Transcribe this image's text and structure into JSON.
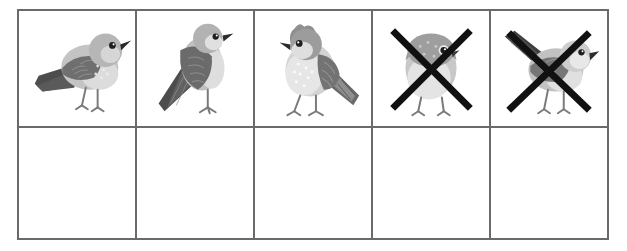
{
  "worksheet": {
    "title": "Bird counting grid",
    "description": "Five-column, two-row table. The top row shows five bird pictures; the last two birds are crossed out with a large black X. The bottom row is empty.",
    "background_color": "#ffffff",
    "border_color": "#6a6a6a",
    "border_width_px": 2,
    "columns": 5,
    "rows": 2
  },
  "palette": {
    "bird_body_light": "#c9c9c9",
    "bird_body_mid": "#b0b0b0",
    "bird_head": "#a8a8a8",
    "bird_wing_dark": "#6e6e6e",
    "bird_tail_dark": "#4a4a4a",
    "bird_belly_pale": "#e2e2e2",
    "bird_outline": "#8a8a8a",
    "leg_color": "#777777",
    "eye_color": "#1e1e1e",
    "beak_color": "#2b2b2b",
    "cross_color": "#111111",
    "cell_background": "#ffffff"
  },
  "cells": {
    "top_row": [
      {
        "index": 1,
        "icon": "bird-icon",
        "pose": "perched-facing-right-long-tail-left",
        "crossed_out": false,
        "label": ""
      },
      {
        "index": 2,
        "icon": "bird-icon",
        "pose": "upright-facing-right-tail-down",
        "crossed_out": false,
        "label": ""
      },
      {
        "index": 3,
        "icon": "bird-icon",
        "pose": "crested-facing-left-spotted-breast",
        "crossed_out": false,
        "label": ""
      },
      {
        "index": 4,
        "icon": "bird-icon",
        "pose": "round-front-facing",
        "crossed_out": true,
        "label": ""
      },
      {
        "index": 5,
        "icon": "bird-icon",
        "pose": "facing-right-tail-raised-left",
        "crossed_out": true,
        "label": ""
      }
    ],
    "bottom_row": [
      {
        "index": 1,
        "content": "",
        "empty": true
      },
      {
        "index": 2,
        "content": "",
        "empty": true
      },
      {
        "index": 3,
        "content": "",
        "empty": true
      },
      {
        "index": 4,
        "content": "",
        "empty": true
      },
      {
        "index": 5,
        "content": "",
        "empty": true
      }
    ]
  },
  "counts": {
    "total_birds": 5,
    "crossed_out": 2,
    "remaining": 3
  }
}
